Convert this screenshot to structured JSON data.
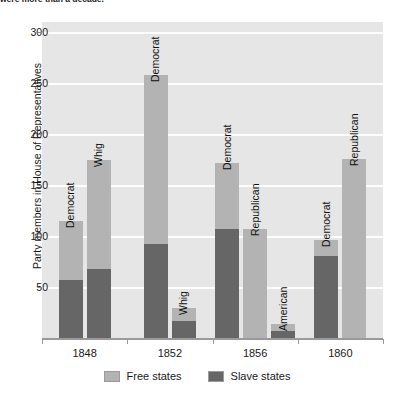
{
  "caption_fragment": "were more than a decade.",
  "chart_data": {
    "type": "bar",
    "subtype": "grouped-stacked",
    "title": "",
    "xlabel": "",
    "ylabel": "Party members in House of Representatives",
    "ylim": [
      0,
      310
    ],
    "yticks": [
      50,
      100,
      150,
      200,
      250,
      300
    ],
    "ytick_labels": [
      "50",
      "100",
      "150",
      "200",
      "250",
      "300"
    ],
    "grid": "horizontal",
    "legend_position": "bottom-center",
    "categories": [
      "1848",
      "1852",
      "1856",
      "1860"
    ],
    "series": [
      {
        "name": "Free states",
        "color": "#b3b3b3"
      },
      {
        "name": "Slave states",
        "color": "#666666"
      }
    ],
    "groups": [
      {
        "year": "1848",
        "bars": [
          {
            "party": "Democrat",
            "free": 58,
            "slave": 57,
            "total": 115
          },
          {
            "party": "Whig",
            "free": 107,
            "slave": 68,
            "total": 175
          }
        ]
      },
      {
        "year": "1852",
        "bars": [
          {
            "party": "Democrat",
            "free": 166,
            "slave": 92,
            "total": 258
          },
          {
            "party": "Whig",
            "free": 12,
            "slave": 17,
            "total": 29
          }
        ]
      },
      {
        "year": "1856",
        "bars": [
          {
            "party": "Democrat",
            "free": 65,
            "slave": 107,
            "total": 172
          },
          {
            "party": "Republican",
            "free": 107,
            "slave": 0,
            "total": 107
          },
          {
            "party": "American",
            "free": 7,
            "slave": 7,
            "total": 14
          }
        ]
      },
      {
        "year": "1860",
        "bars": [
          {
            "party": "Democrat",
            "free": 16,
            "slave": 80,
            "total": 96
          },
          {
            "party": "Republican",
            "free": 176,
            "slave": 0,
            "total": 176
          }
        ]
      }
    ]
  }
}
